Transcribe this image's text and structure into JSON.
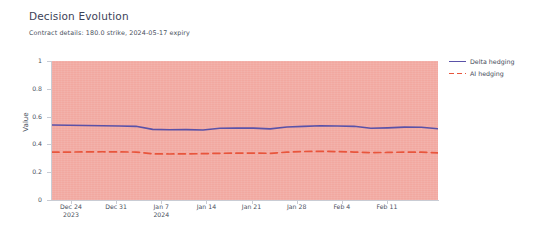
{
  "chart_data": {
    "type": "line",
    "title": "Decision Evolution",
    "subtitle": "Contract details: 180.0 strike, 2024-05-17 expiry",
    "xlabel": "",
    "ylabel": "Value",
    "ylim": [
      0,
      1
    ],
    "y_ticks": [
      "1",
      "0.8",
      "0.6",
      "0.4",
      "0.2",
      "0"
    ],
    "grid": false,
    "legend_position": "right",
    "plot_background_color": "#f2a8a0",
    "x_tick_labels": [
      {
        "line1": "Dec 24",
        "line2": "2023"
      },
      {
        "line1": "Dec 31",
        "line2": ""
      },
      {
        "line1": "Jan 7",
        "line2": "2024"
      },
      {
        "line1": "Jan 14",
        "line2": ""
      },
      {
        "line1": "Jan 21",
        "line2": ""
      },
      {
        "line1": "Jan 28",
        "line2": ""
      },
      {
        "line1": "Feb 4",
        "line2": ""
      },
      {
        "line1": "Feb 11",
        "line2": ""
      }
    ],
    "x": [
      "2023-12-24",
      "2023-12-26",
      "2023-12-28",
      "2023-12-31",
      "2024-01-02",
      "2024-01-04",
      "2024-01-07",
      "2024-01-09",
      "2024-01-11",
      "2024-01-14",
      "2024-01-16",
      "2024-01-18",
      "2024-01-21",
      "2024-01-23",
      "2024-01-25",
      "2024-01-28",
      "2024-01-30",
      "2024-02-01",
      "2024-02-04",
      "2024-02-06",
      "2024-02-08",
      "2024-02-11",
      "2024-02-13",
      "2024-02-15"
    ],
    "series": [
      {
        "name": "Delta hedging",
        "color": "#5a52a8",
        "style": "solid",
        "values": [
          0.54,
          0.538,
          0.536,
          0.534,
          0.532,
          0.53,
          0.508,
          0.505,
          0.506,
          0.504,
          0.516,
          0.518,
          0.517,
          0.512,
          0.525,
          0.53,
          0.534,
          0.532,
          0.53,
          0.516,
          0.519,
          0.524,
          0.523,
          0.513
        ]
      },
      {
        "name": "AI hedging",
        "color": "#e8553c",
        "style": "dashed",
        "values": [
          0.344,
          0.345,
          0.346,
          0.347,
          0.346,
          0.345,
          0.332,
          0.331,
          0.332,
          0.333,
          0.336,
          0.337,
          0.338,
          0.336,
          0.344,
          0.349,
          0.35,
          0.348,
          0.345,
          0.341,
          0.342,
          0.345,
          0.344,
          0.339
        ]
      }
    ]
  }
}
